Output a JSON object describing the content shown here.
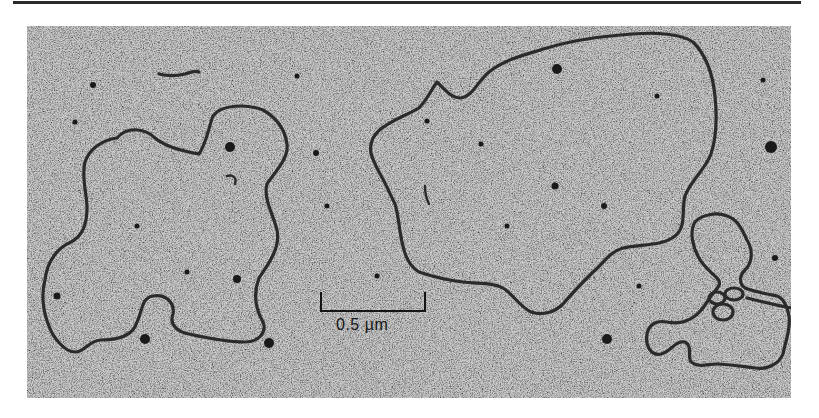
{
  "figure": {
    "type": "electron-micrograph",
    "scale_bar": {
      "label": "0.5 µm",
      "value": 0.5,
      "unit": "µm"
    },
    "colors": {
      "background_field": "#b4b4b4",
      "strand": "#2b2b2b",
      "page": "#ffffff",
      "rule": "#2a2a2a"
    }
  }
}
